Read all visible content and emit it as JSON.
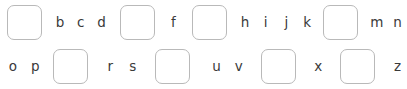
{
  "exercise": {
    "title": "Alphabet Fill-in-the-Blank",
    "instruction": "",
    "letter_color": "#3a3a3a",
    "blank_border_color": "#b9b9b9",
    "background_color": "#ffffff",
    "blank_label": "",
    "total_slots": 26,
    "rows": [
      {
        "id": "row-1",
        "slots": [
          {
            "type": "blank",
            "answer": "a",
            "text": ""
          },
          {
            "type": "letter",
            "answer": "b",
            "text": "b"
          },
          {
            "type": "letter",
            "answer": "c",
            "text": "c"
          },
          {
            "type": "letter",
            "answer": "d",
            "text": "d"
          },
          {
            "type": "blank",
            "answer": "e",
            "text": ""
          },
          {
            "type": "letter",
            "answer": "f",
            "text": "f"
          },
          {
            "type": "blank",
            "answer": "g",
            "text": ""
          },
          {
            "type": "letter",
            "answer": "h",
            "text": "h"
          },
          {
            "type": "letter",
            "answer": "i",
            "text": "i"
          },
          {
            "type": "letter",
            "answer": "j",
            "text": "j"
          },
          {
            "type": "letter",
            "answer": "k",
            "text": "k"
          },
          {
            "type": "blank",
            "answer": "l",
            "text": ""
          },
          {
            "type": "letter",
            "answer": "m",
            "text": "m"
          },
          {
            "type": "letter",
            "answer": "n",
            "text": "n"
          }
        ]
      },
      {
        "id": "row-2",
        "slots": [
          {
            "type": "letter",
            "answer": "o",
            "text": "o"
          },
          {
            "type": "letter",
            "answer": "p",
            "text": "p"
          },
          {
            "type": "blank",
            "answer": "q",
            "text": ""
          },
          {
            "type": "letter",
            "answer": "r",
            "text": "r"
          },
          {
            "type": "letter",
            "answer": "s",
            "text": "s"
          },
          {
            "type": "blank",
            "answer": "t",
            "text": ""
          },
          {
            "type": "letter",
            "answer": "u",
            "text": "u"
          },
          {
            "type": "letter",
            "answer": "v",
            "text": "v"
          },
          {
            "type": "blank",
            "answer": "w",
            "text": ""
          },
          {
            "type": "letter",
            "answer": "x",
            "text": "x"
          },
          {
            "type": "blank",
            "answer": "y",
            "text": ""
          },
          {
            "type": "letter",
            "answer": "z",
            "text": "z"
          }
        ]
      }
    ]
  }
}
